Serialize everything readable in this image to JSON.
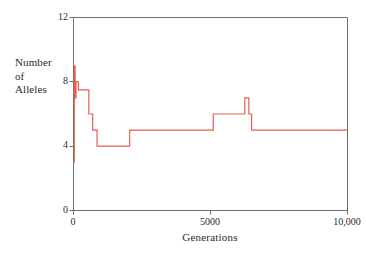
{
  "figure": {
    "background_color": "#ffffff",
    "axis_color": "#6e6e6e",
    "text_color": "#2b2b2b",
    "series_color": "#e8604c"
  },
  "chart_data": {
    "type": "line",
    "title": "",
    "subtitle": "",
    "xlabel": "Generations",
    "ylabel": "Number of Alleles",
    "ylabel_lines": [
      "Number",
      "of",
      "Alleles"
    ],
    "xlim": [
      0,
      10000
    ],
    "ylim": [
      0,
      12
    ],
    "xticks": [
      0,
      5000,
      10000
    ],
    "xtick_labels": [
      "0",
      "5000",
      "10,000"
    ],
    "yticks": [
      0,
      4,
      8,
      12
    ],
    "ytick_labels": [
      "0",
      "4",
      "8",
      "12"
    ],
    "grid": false,
    "legend": null,
    "legend_position": "none",
    "frame": "box",
    "line_style": "step-post",
    "series": [
      {
        "name": "Number of Alleles",
        "color": "#e8604c",
        "x": [
          0,
          30,
          60,
          90,
          130,
          180,
          250,
          330,
          430,
          560,
          700,
          860,
          1000,
          1150,
          1950,
          2050,
          5000,
          5100,
          6150,
          6250,
          6400,
          6500,
          10000
        ],
        "y": [
          3,
          9,
          7,
          8,
          8,
          7.5,
          7.5,
          7.5,
          7.5,
          6,
          5,
          4,
          4,
          4,
          4,
          5,
          5,
          6,
          6,
          7,
          6,
          5,
          5
        ],
        "step_points": [
          {
            "generation": 0,
            "alleles": 3,
            "note": "start of spike"
          },
          {
            "generation": 40,
            "alleles": 9,
            "note": "initial peak"
          },
          {
            "generation": 70,
            "alleles": 7
          },
          {
            "generation": 110,
            "alleles": 8,
            "note": "plateau at 8"
          },
          {
            "generation": 200,
            "alleles": 7.5
          },
          {
            "generation": 560,
            "alleles": 6
          },
          {
            "generation": 720,
            "alleles": 5
          },
          {
            "generation": 880,
            "alleles": 4,
            "note": "low plateau at 4"
          },
          {
            "generation": 1950,
            "alleles": 5,
            "note": "rise to 5"
          },
          {
            "generation": 5050,
            "alleles": 6,
            "note": "rise to 6"
          },
          {
            "generation": 6180,
            "alleles": 7,
            "note": "secondary peak"
          },
          {
            "generation": 6380,
            "alleles": 6
          },
          {
            "generation": 6480,
            "alleles": 5,
            "note": "settles at 5"
          },
          {
            "generation": 10000,
            "alleles": 5,
            "note": "end"
          }
        ]
      }
    ]
  }
}
